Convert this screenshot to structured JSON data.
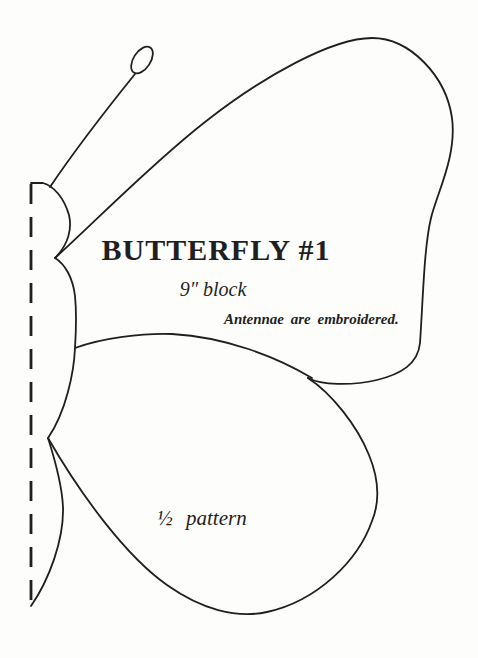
{
  "page": {
    "title": "BUTTERFLY #1",
    "block_size": "9″ block",
    "note": "Antennae are embroidered.",
    "pattern_label": "½ pattern"
  },
  "diagram": {
    "parts": [
      "fold-line",
      "body",
      "antenna",
      "antenna-tip",
      "upper-wing",
      "wing-seam",
      "lower-wing"
    ]
  },
  "colors": {
    "ink": "#1f1f1f",
    "paper": "#fdfdfc"
  }
}
